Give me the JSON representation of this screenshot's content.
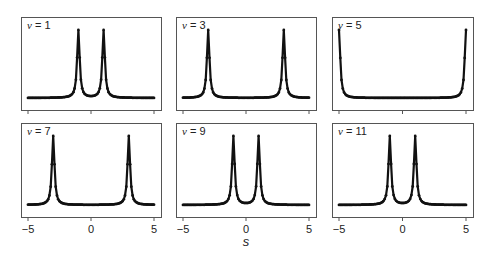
{
  "chart_data": {
    "type": "line",
    "layout": "2x3 small multiples",
    "xlabel": "s",
    "ylabel": "",
    "xlim": [
      -5,
      5
    ],
    "xticks": [
      -5,
      0,
      5
    ],
    "grid": false,
    "legend": null,
    "panels": [
      {
        "label": "ν = 1",
        "nu": 1,
        "peaks": [
          -1,
          1
        ]
      },
      {
        "label": "ν = 3",
        "nu": 3,
        "peaks": [
          -3,
          3
        ]
      },
      {
        "label": "ν = 5",
        "nu": 5,
        "peaks": [
          -5,
          5
        ]
      },
      {
        "label": "ν = 7",
        "nu": 7,
        "peaks": [
          -3,
          3
        ]
      },
      {
        "label": "ν = 9",
        "nu": 9,
        "peaks": [
          -1,
          1
        ]
      },
      {
        "label": "ν = 11",
        "nu": 11,
        "peaks": [
          -1,
          1
        ]
      }
    ],
    "series_style": {
      "line_color": "#111111",
      "marker": "dot",
      "points": 101
    }
  },
  "axis": {
    "tick_labels": [
      "-5",
      "0",
      "5"
    ],
    "xlabel": "s"
  },
  "colors": {
    "line": "#111111",
    "frame": "#555555",
    "background": "#ffffff"
  }
}
